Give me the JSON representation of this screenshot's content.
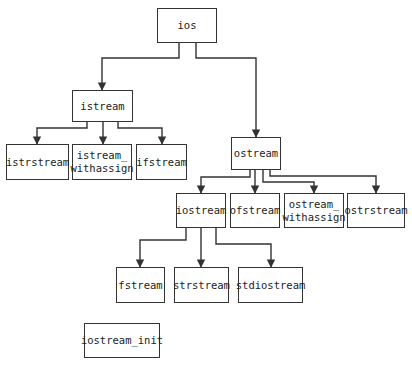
{
  "diagram": {
    "nodes": [
      {
        "id": "ios",
        "label": "ios",
        "x": 157,
        "y": 8,
        "w": 60,
        "h": 35
      },
      {
        "id": "istream",
        "label": "istream",
        "x": 72,
        "y": 90,
        "w": 61,
        "h": 32
      },
      {
        "id": "istrstream",
        "label": "istrstream",
        "x": 6,
        "y": 144,
        "w": 63,
        "h": 36
      },
      {
        "id": "istream_withassign",
        "label": "istream_\nwithassign",
        "x": 72,
        "y": 144,
        "w": 60,
        "h": 36
      },
      {
        "id": "ifstream",
        "label": "ifstream",
        "x": 136,
        "y": 144,
        "w": 51,
        "h": 36
      },
      {
        "id": "ostream",
        "label": "ostream",
        "x": 231,
        "y": 137,
        "w": 50,
        "h": 33
      },
      {
        "id": "iostream",
        "label": "iostream",
        "x": 176,
        "y": 193,
        "w": 50,
        "h": 35
      },
      {
        "id": "ofstream",
        "label": "ofstream",
        "x": 230,
        "y": 193,
        "w": 50,
        "h": 35
      },
      {
        "id": "ostream_withassign",
        "label": "ostream_\nwithassign",
        "x": 284,
        "y": 193,
        "w": 60,
        "h": 35
      },
      {
        "id": "ostrstream",
        "label": "ostrstream",
        "x": 347,
        "y": 193,
        "w": 58,
        "h": 35
      },
      {
        "id": "fstream",
        "label": "fstream",
        "x": 116,
        "y": 267,
        "w": 49,
        "h": 36
      },
      {
        "id": "strstream",
        "label": "strstream",
        "x": 174,
        "y": 267,
        "w": 55,
        "h": 36
      },
      {
        "id": "stdiostream",
        "label": "stdiostream",
        "x": 238,
        "y": 267,
        "w": 65,
        "h": 36
      },
      {
        "id": "iostream_init",
        "label": "iostream_init",
        "x": 84,
        "y": 323,
        "w": 76,
        "h": 35
      }
    ],
    "edges": [
      {
        "from": "ios",
        "to": "istream",
        "points": [
          [
            179,
            43
          ],
          [
            179,
            58
          ],
          [
            102,
            58
          ],
          [
            102,
            90
          ]
        ]
      },
      {
        "from": "ios",
        "to": "ostream",
        "points": [
          [
            196,
            43
          ],
          [
            196,
            58
          ],
          [
            256,
            58
          ],
          [
            256,
            137
          ]
        ]
      },
      {
        "from": "istream",
        "to": "istrstream",
        "points": [
          [
            87,
            122
          ],
          [
            87,
            128
          ],
          [
            37,
            128
          ],
          [
            37,
            144
          ]
        ]
      },
      {
        "from": "istream",
        "to": "istream_withassign",
        "points": [
          [
            103,
            122
          ],
          [
            103,
            144
          ]
        ]
      },
      {
        "from": "istream",
        "to": "ifstream",
        "points": [
          [
            118,
            122
          ],
          [
            118,
            128
          ],
          [
            162,
            128
          ],
          [
            162,
            144
          ]
        ]
      },
      {
        "from": "ostream",
        "to": "iostream",
        "points": [
          [
            250,
            170
          ],
          [
            250,
            177
          ],
          [
            201,
            177
          ],
          [
            201,
            193
          ]
        ]
      },
      {
        "from": "ostream",
        "to": "ofstream",
        "points": [
          [
            255,
            170
          ],
          [
            255,
            193
          ]
        ]
      },
      {
        "from": "ostream",
        "to": "ostream_withassign",
        "points": [
          [
            263,
            170
          ],
          [
            263,
            182
          ],
          [
            314,
            182
          ],
          [
            314,
            193
          ]
        ]
      },
      {
        "from": "ostream",
        "to": "ostrstream",
        "points": [
          [
            270,
            170
          ],
          [
            270,
            176
          ],
          [
            376,
            176
          ],
          [
            376,
            193
          ]
        ]
      },
      {
        "from": "iostream",
        "to": "fstream",
        "points": [
          [
            186,
            228
          ],
          [
            186,
            240
          ],
          [
            140,
            240
          ],
          [
            140,
            267
          ]
        ]
      },
      {
        "from": "iostream",
        "to": "strstream",
        "points": [
          [
            201,
            228
          ],
          [
            201,
            267
          ]
        ]
      },
      {
        "from": "iostream",
        "to": "stdiostream",
        "points": [
          [
            216,
            228
          ],
          [
            216,
            244
          ],
          [
            271,
            244
          ],
          [
            271,
            267
          ]
        ]
      }
    ],
    "colors": {
      "stroke": "#333333",
      "background": "#ffffff",
      "text": "#222222"
    }
  }
}
